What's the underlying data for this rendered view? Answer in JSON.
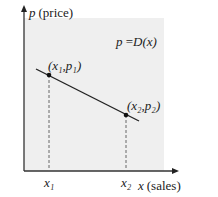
{
  "diagram": {
    "type": "demand-curve",
    "y_axis_label": {
      "var": "p",
      "unit": "(price)"
    },
    "x_axis_label": {
      "var": "x",
      "unit": "(sales)"
    },
    "equation": {
      "lhs": "p",
      "eq": " =",
      "rhs": "D(x)"
    },
    "points": [
      {
        "label": "(x₁,p₁)",
        "x_tick": "x₁"
      },
      {
        "label": "(x₂,p₂)",
        "x_tick": "x₂"
      }
    ],
    "colors": {
      "background_region": "#efefef",
      "line": "#222222",
      "axis": "#333333",
      "dashed": "#666666"
    }
  }
}
